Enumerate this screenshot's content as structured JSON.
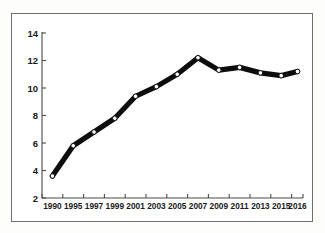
{
  "chart_data": {
    "type": "line",
    "title": "",
    "subtitle": "",
    "xlabel": "",
    "ylabel": "",
    "categories": [
      "1990",
      "1995",
      "1997",
      "1999",
      "2001",
      "2003",
      "2005",
      "2007",
      "2009",
      "2011",
      "2013",
      "2015",
      "2016"
    ],
    "x": [
      1990,
      1995,
      1997,
      1999,
      2001,
      2003,
      2005,
      2007,
      2009,
      2011,
      2013,
      2015,
      2016
    ],
    "values": [
      3.6,
      5.8,
      6.8,
      7.8,
      9.4,
      10.1,
      11.0,
      12.2,
      11.3,
      11.5,
      11.1,
      10.9,
      11.2
    ],
    "series": [
      {
        "name": "",
        "values": [
          3.6,
          5.8,
          6.8,
          7.8,
          9.4,
          10.1,
          11.0,
          12.2,
          11.3,
          11.5,
          11.1,
          10.9,
          11.2
        ]
      }
    ],
    "ylim": [
      2,
      14
    ],
    "yticks": [
      2,
      4,
      6,
      8,
      10,
      12,
      14
    ],
    "ytick_labels": [
      "2",
      "4",
      "6",
      "8",
      "10",
      "12",
      "14"
    ],
    "xtick_labels": [
      "1990",
      "1995",
      "1997",
      "1999",
      "2001",
      "2003",
      "2005",
      "2007",
      "2009",
      "2011",
      "2013",
      "2015",
      "2016"
    ],
    "grid": false,
    "legend": false,
    "legend_position": "none",
    "line_color": "#0d0d0d",
    "marker_color": "#ffffff",
    "marker_edge_color": "#0d0d0d",
    "background_color": "#ffffff",
    "frame_color": "#6e6e6e",
    "axis_color": "#4a4a4a"
  }
}
